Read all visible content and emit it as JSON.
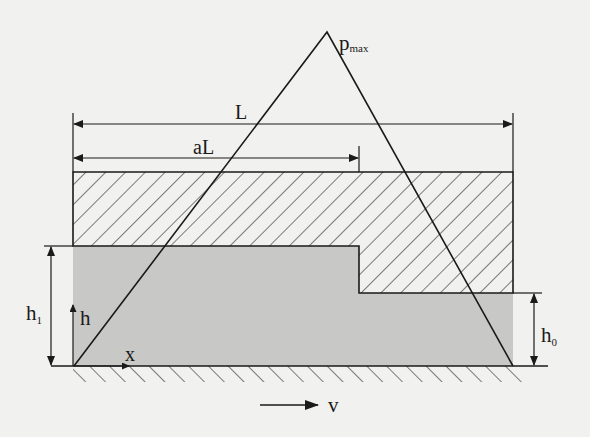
{
  "diagram": {
    "labels": {
      "pmax_main": "p",
      "pmax_sub": "max",
      "length": "L",
      "step_length": "aL",
      "inlet_height_main": "h",
      "inlet_height_sub": "1",
      "outlet_height_main": "h",
      "outlet_height_sub": "0",
      "height_axis": "h",
      "x_axis": "x",
      "velocity": "v"
    },
    "colors": {
      "background": "#f1f1ef",
      "line": "#1a1a1a",
      "fluid_fill": "#c8c8c6",
      "hatch": "#2a2a2a"
    },
    "parameters": {
      "step_position_fraction": "a",
      "pressure_peak_location": "at step (x = aL)"
    }
  }
}
